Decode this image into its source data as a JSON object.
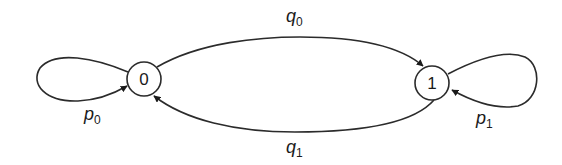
{
  "diagram": {
    "type": "state-transition",
    "nodes": [
      {
        "id": "0",
        "label": "0"
      },
      {
        "id": "1",
        "label": "1"
      }
    ],
    "edges": [
      {
        "from": "0",
        "to": "0",
        "label_main": "p",
        "label_sub": "0"
      },
      {
        "from": "0",
        "to": "1",
        "label_main": "q",
        "label_sub": "0"
      },
      {
        "from": "1",
        "to": "0",
        "label_main": "q",
        "label_sub": "1"
      },
      {
        "from": "1",
        "to": "1",
        "label_main": "p",
        "label_sub": "1"
      }
    ],
    "colors": {
      "stroke": "#2b2b2b",
      "background": "#ffffff"
    }
  }
}
